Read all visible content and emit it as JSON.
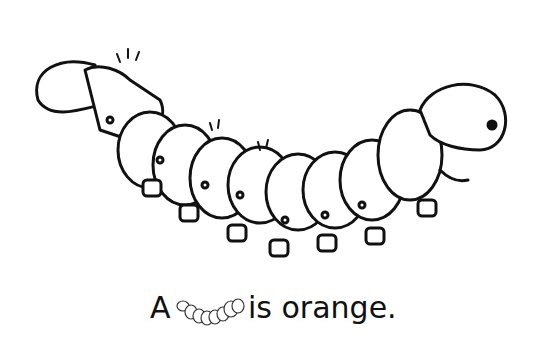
{
  "caption": {
    "prefix": "A",
    "suffix": "is orange."
  },
  "illustration": {
    "subject": "caterpillar",
    "style": "black line art coloring page"
  }
}
